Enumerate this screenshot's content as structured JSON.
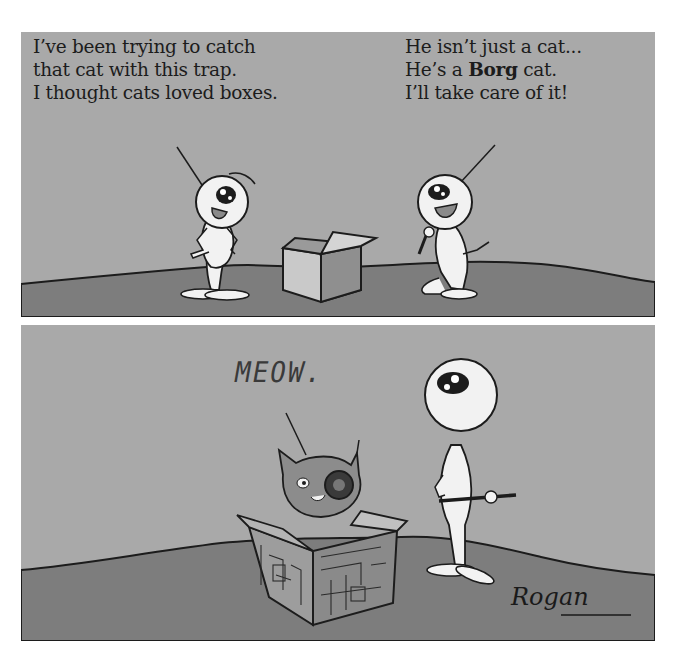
{
  "comic": {
    "panels": [
      {
        "id": "top",
        "captions": {
          "left_speaker": {
            "lines": [
              "I’ve been trying to catch",
              "that cat with this trap.",
              "I thought cats loved boxes."
            ]
          },
          "right_speaker": {
            "line1": "He isn’t just a cat...",
            "line2_pre": "He’s a ",
            "line2_bold": "Borg",
            "line2_post": " cat.",
            "line3": "I’ll take care of it!"
          }
        },
        "elements": [
          "alien-left",
          "cardboard-box",
          "alien-right-with-tool"
        ]
      },
      {
        "id": "bottom",
        "sound_effect": "MEOW.",
        "signature": "Rogan",
        "elements": [
          "borg-cat",
          "circuit-box",
          "alien-with-tool"
        ]
      }
    ],
    "colors": {
      "sky": "#a9a9a9",
      "ground": "#7d7d7d",
      "ink": "#1c1c1c",
      "figure": "#f2f2f2"
    }
  }
}
